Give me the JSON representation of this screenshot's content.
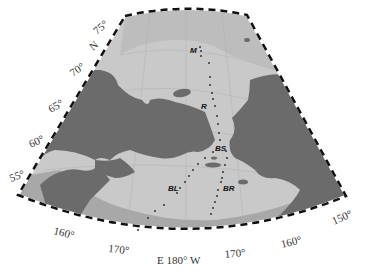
{
  "map": {
    "projection": "conic",
    "colors": {
      "sea_shallow": "#c9c9c9",
      "sea_mid": "#b4b4b4",
      "sea_deep": "#9a9a9a",
      "land": "#6b6b6b",
      "frame": "#111111",
      "station": "#333333"
    },
    "latitude_labels": [
      {
        "text": "75°",
        "x": 100,
        "y": 38,
        "rot": -50
      },
      {
        "text": "N",
        "x": 97,
        "y": 53,
        "rot": -50
      },
      {
        "text": "70°",
        "x": 78,
        "y": 76,
        "rot": -40
      },
      {
        "text": "65°",
        "x": 55,
        "y": 112,
        "rot": -35
      },
      {
        "text": "60°",
        "x": 35,
        "y": 146,
        "rot": -30
      },
      {
        "text": "55°",
        "x": 13,
        "y": 180,
        "rot": -25
      }
    ],
    "longitude_labels": [
      {
        "text": "160°",
        "x": 56,
        "y": 238,
        "rot": 15
      },
      {
        "text": "170°",
        "x": 112,
        "y": 253,
        "rot": 6
      },
      {
        "text": "E 180° W",
        "x": 183,
        "y": 262,
        "rot": 0
      },
      {
        "text": "170°",
        "x": 238,
        "y": 255,
        "rot": -6
      },
      {
        "text": "160°",
        "x": 292,
        "y": 242,
        "rot": -15
      },
      {
        "text": "150°",
        "x": 338,
        "y": 220,
        "rot": -25
      }
    ],
    "stations": [
      {
        "label": "M",
        "x": 196,
        "y": 50
      },
      {
        "label": "R",
        "x": 208,
        "y": 106
      },
      {
        "label": "BS",
        "x": 217,
        "y": 151
      },
      {
        "label": "BL",
        "x": 174,
        "y": 189
      },
      {
        "label": "BR",
        "x": 222,
        "y": 189
      }
    ]
  }
}
